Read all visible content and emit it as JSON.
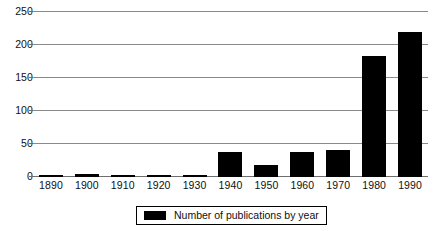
{
  "chart_data": {
    "type": "bar",
    "title": "",
    "xlabel": "",
    "ylabel": "",
    "categories": [
      "1890",
      "1900",
      "1910",
      "1920",
      "1930",
      "1940",
      "1950",
      "1960",
      "1970",
      "1980",
      "1990"
    ],
    "values": [
      2,
      5,
      2,
      2,
      1,
      38,
      18,
      38,
      41,
      183,
      220
    ],
    "series": [
      {
        "name": "Number of publications by year",
        "color": "#000000",
        "values": [
          2,
          5,
          2,
          2,
          1,
          38,
          18,
          38,
          41,
          183,
          220
        ]
      }
    ],
    "ylim": [
      0,
      250
    ],
    "ytick_labels": [
      "0",
      "50",
      "100",
      "150",
      "200",
      "250"
    ],
    "ytick_values": [
      0,
      50,
      100,
      150,
      200,
      250
    ],
    "grid": true,
    "legend_position": "bottom-center"
  },
  "legend": {
    "entries": [
      {
        "label": "Number of publications by year",
        "swatch_color": "#000000"
      }
    ]
  },
  "colors": {
    "bar": "#000000",
    "gridline": "#8a8a8a",
    "axis": "#6e6e6e",
    "text": "#101010",
    "background": "#ffffff"
  }
}
